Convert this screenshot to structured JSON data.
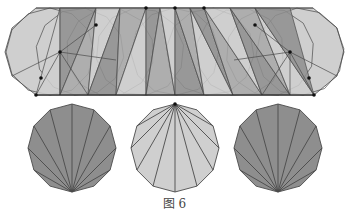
{
  "figure": {
    "caption": "图 6",
    "colors": {
      "light_fill": "#cfcfcf",
      "dark_fill": "#8e8e8e",
      "mid_fill": "#a8a8a8",
      "stroke": "#4a4a4a",
      "dot": "#111111"
    },
    "top_strip": {
      "description": "Unfolded strip of dodecagons sweeping across, with triangulated fan regions",
      "bounds": {
        "x_min": 5,
        "x_max": 344,
        "y_top": 8,
        "y_bottom": 95
      },
      "marked_points": [
        [
          36,
          95
        ],
        [
          41,
          78
        ],
        [
          60,
          52
        ],
        [
          96,
          25
        ],
        [
          146,
          8
        ],
        [
          175,
          8
        ],
        [
          204,
          8
        ],
        [
          255,
          25
        ],
        [
          290,
          52
        ],
        [
          309,
          78
        ],
        [
          314,
          95
        ]
      ]
    },
    "bottom_polygons": [
      {
        "name": "left-dodecagon",
        "cx": 72,
        "cy": 148,
        "r": 44,
        "fan_apex": "bottom",
        "shade": "dark"
      },
      {
        "name": "middle-dodecagon",
        "cx": 175,
        "cy": 148,
        "r": 44,
        "fan_apex": "top",
        "shade": "light"
      },
      {
        "name": "right-dodecagon",
        "cx": 278,
        "cy": 148,
        "r": 44,
        "fan_apex": "bottom",
        "shade": "dark"
      }
    ]
  }
}
